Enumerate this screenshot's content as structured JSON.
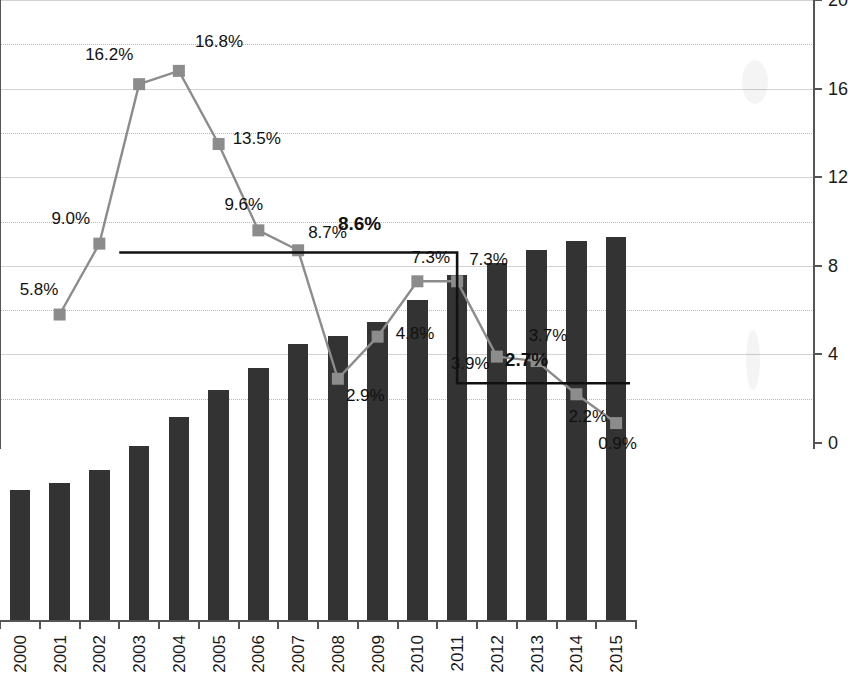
{
  "axis_titles": {
    "left": "10",
    "left_sup": "8",
    "left_unit": "Tce",
    "right": "%"
  },
  "legend": {
    "items": [
      {
        "label": "Primary energy consumption",
        "marker": "bar-swatch-icon",
        "color": "#333333"
      },
      {
        "label": "Growth rate",
        "marker": "line-square-marker-icon",
        "color": "#8c8c8c"
      },
      {
        "label": "AAGR",
        "marker": "line-icon",
        "color": "#111111"
      }
    ]
  },
  "chart_data": {
    "type": "bar",
    "title": "",
    "xlabel": "",
    "ylabel": "10^8 Tce",
    "y2label": "%",
    "ylim": [
      0,
      50
    ],
    "y2lim": [
      0,
      20
    ],
    "ytick_labels": [
      "0.0",
      "5.0",
      "10.0",
      "15.0",
      "20.0",
      "25.0",
      "30.0",
      "35.0",
      "40.0",
      "45.0",
      "50.0"
    ],
    "y2tick_labels": [
      "0",
      "4",
      "8",
      "12",
      "16",
      "20"
    ],
    "grid": true,
    "legend_position": "top-center",
    "categories": [
      "2000",
      "2001",
      "2002",
      "2003",
      "2004",
      "2005",
      "2006",
      "2007",
      "2008",
      "2009",
      "2010",
      "2011",
      "2012",
      "2013",
      "2014",
      "2015"
    ],
    "series": [
      {
        "name": "Primary energy consumption",
        "type": "bar",
        "axis": "left",
        "color": "#333333",
        "values": [
          14.8,
          15.6,
          17.0,
          19.7,
          23.0,
          26.1,
          28.6,
          31.3,
          32.2,
          33.8,
          36.2,
          39.0,
          40.4,
          41.9,
          42.9,
          43.3
        ]
      },
      {
        "name": "Growth rate",
        "type": "line",
        "axis": "right",
        "color": "#8c8c8c",
        "values": [
          null,
          5.8,
          9.0,
          16.2,
          16.8,
          13.5,
          9.6,
          8.7,
          2.9,
          4.8,
          7.3,
          7.3,
          3.9,
          3.7,
          2.2,
          0.9
        ],
        "point_labels": [
          "",
          "5.8%",
          "9.0%",
          "16.2%",
          "16.8%",
          "13.5%",
          "9.6%",
          "8.7%",
          "2.9%",
          "4.8%",
          "7.3%",
          "7.3%",
          "3.9%",
          "3.7%",
          "2.2%",
          "0.9%"
        ]
      },
      {
        "name": "AAGR",
        "type": "step-line",
        "axis": "right",
        "color": "#111111",
        "segments": [
          {
            "from": "2002",
            "to": "2011",
            "value": 8.6,
            "label": "8.6%"
          },
          {
            "from": "2011",
            "to": "2015",
            "value": 2.7,
            "label": "2.7%"
          }
        ]
      }
    ]
  }
}
